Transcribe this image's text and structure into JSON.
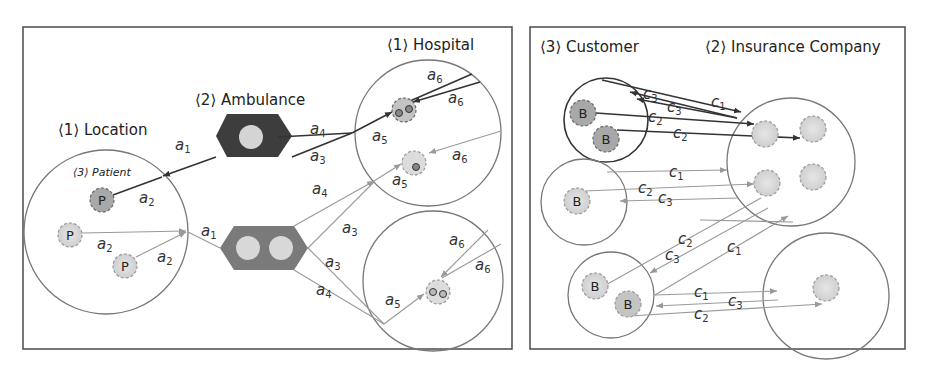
{
  "left_panel": {
    "title_location": "⟨1⟩ Location",
    "title_patient": "⟨3⟩ Patient",
    "title_ambulance": "⟨2⟩ Ambulance",
    "title_hospital": "⟨1⟩ Hospital",
    "nodes": {
      "patient_label": "P"
    },
    "edge_labels": {
      "a1": "a",
      "a1_sub": "1",
      "a2": "a",
      "a2_sub": "2",
      "a3": "a",
      "a3_sub": "3",
      "a4": "a",
      "a4_sub": "4",
      "a5": "a",
      "a5_sub": "5",
      "a6": "a",
      "a6_sub": "6"
    }
  },
  "right_panel": {
    "title_customer": "⟨3⟩ Customer",
    "title_insurance": "⟨2⟩ Insurance Company",
    "nodes": {
      "customer_label": "B"
    },
    "edge_labels": {
      "c1": "c",
      "c1_sub": "1",
      "c2": "c",
      "c2_sub": "2",
      "c3": "c",
      "c3_sub": "3"
    }
  },
  "colors": {
    "ambulance_dark": "#3d3d3d",
    "ambulance_light": "#7a7a7a",
    "node_fill": "#d8d8d8",
    "node_fill_dark": "#a8a8a8",
    "edge_dark": "#333333",
    "edge_light": "#999999"
  }
}
